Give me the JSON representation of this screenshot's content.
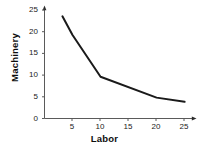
{
  "chart_data": {
    "type": "line",
    "title": "",
    "subtitle": "",
    "xlabel": "Labor",
    "ylabel": "Machinery",
    "xlim": [
      0,
      26.5
    ],
    "ylim": [
      0,
      26
    ],
    "xticks": [
      5,
      10,
      15,
      20,
      25
    ],
    "yticks": [
      0,
      5,
      10,
      15,
      20,
      25
    ],
    "grid": false,
    "legend": false,
    "legend_position": "none",
    "axis_arrows": true,
    "line_color": "#1a1a1a",
    "background_color": "#ffffff",
    "series": [
      {
        "name": "isoquant",
        "x": [
          3.2,
          5,
          10,
          20,
          25
        ],
        "values": [
          24.5,
          20,
          10,
          5,
          4
        ]
      }
    ],
    "annotations": []
  },
  "axes": {
    "y_tick_labels": [
      "25",
      "20",
      "15",
      "10",
      "5",
      "0"
    ],
    "x_tick_labels": [
      "5",
      "10",
      "15",
      "20",
      "25"
    ],
    "x_title": "Labor",
    "y_title": "Machinery"
  }
}
